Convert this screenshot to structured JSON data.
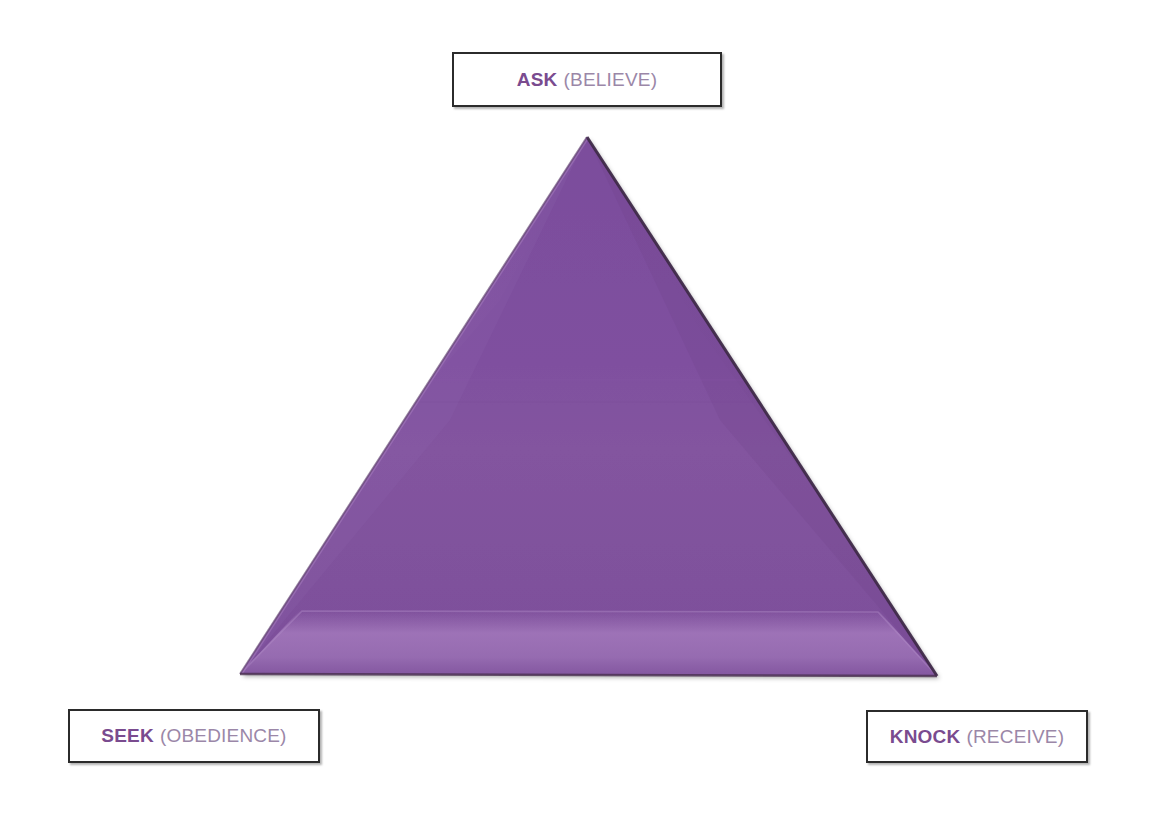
{
  "diagram": {
    "shape": "triangle",
    "colors": {
      "triangle_fill": "#7d4f9e",
      "triangle_fill_light": "#8a5aa8",
      "triangle_bevel_highlight": "#9a70b4",
      "triangle_bevel_shadow": "#6d4289",
      "triangle_outline": "#4a3050",
      "background": "#ffffff",
      "box_border": "#2b2b2b",
      "box_fill": "#ffffff",
      "keyword_text": "#7a4b8f",
      "paren_text": "#9b87a8"
    },
    "vertices": {
      "apex": {
        "x": 587,
        "y": 137
      },
      "bottom_left": {
        "x": 240,
        "y": 674
      },
      "bottom_right": {
        "x": 937,
        "y": 676
      }
    },
    "labels": [
      {
        "id": "ask",
        "position": "top",
        "keyword": "ASK",
        "parenthetical": "(BELIEVE)"
      },
      {
        "id": "seek",
        "position": "bottom-left",
        "keyword": "SEEK",
        "parenthetical": "(OBEDIENCE)"
      },
      {
        "id": "knock",
        "position": "bottom-right",
        "keyword": "KNOCK",
        "parenthetical": "(RECEIVE)"
      }
    ]
  }
}
